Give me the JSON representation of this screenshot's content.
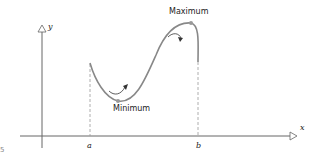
{
  "diagram": {
    "axis_labels": {
      "x": "x",
      "y": "y"
    },
    "tick_labels": {
      "a": "a",
      "b": "b"
    },
    "annotations": {
      "maximum": "Maximum",
      "minimum": "Minimum"
    },
    "margin_mark": "5",
    "colors": {
      "curve": "#888888",
      "axis": "#666666",
      "dashed": "#999999",
      "text": "#222222",
      "arrow": "#333333"
    }
  }
}
